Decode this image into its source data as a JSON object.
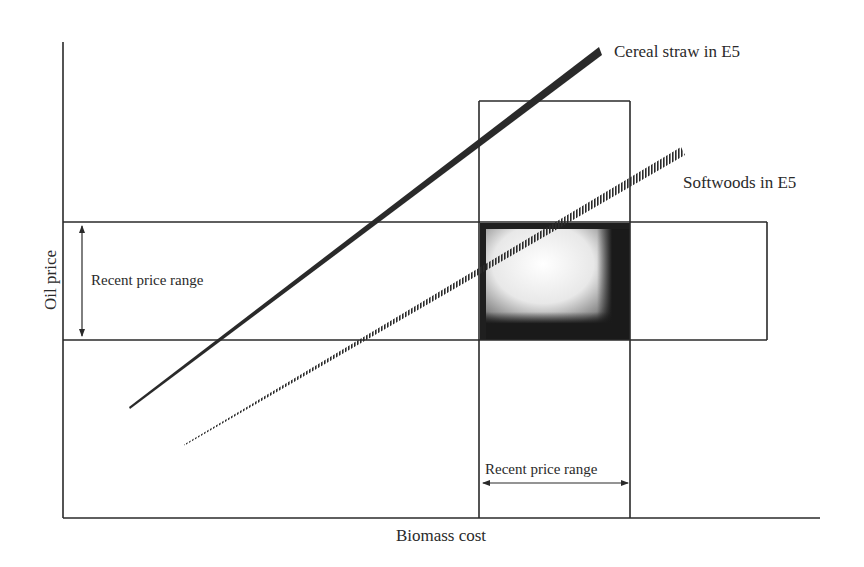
{
  "diagram": {
    "axes": {
      "x_label": "Biomass cost",
      "y_label": "Oil price"
    },
    "bands": {
      "horizontal_label": "Recent price range",
      "vertical_label": "Recent price range"
    },
    "lines": [
      {
        "name": "Cereal straw in E5",
        "style": "solid-thick"
      },
      {
        "name": "Softwoods in E5",
        "style": "hatched-tapered"
      }
    ],
    "colors": {
      "ink": "#2a2a2a",
      "background": "#ffffff",
      "overlap_dark": "#1a1a1a",
      "overlap_light": "#ffffff"
    }
  }
}
